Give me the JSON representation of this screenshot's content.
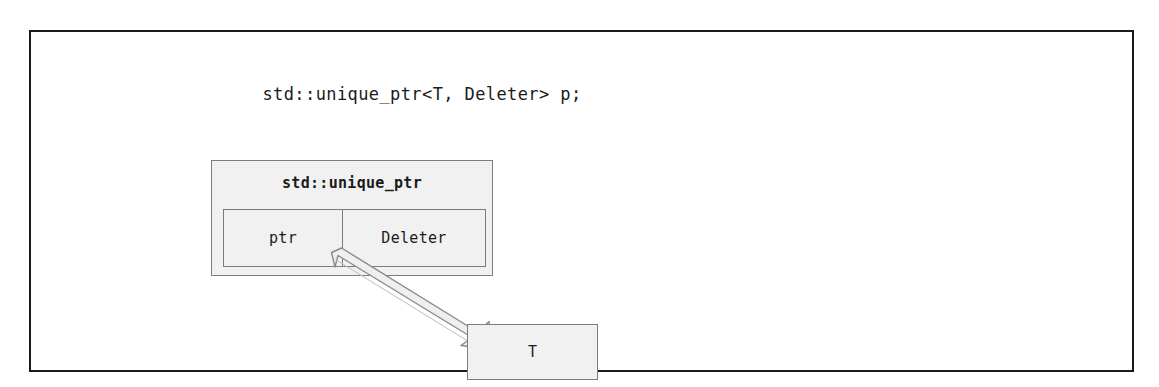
{
  "diagram": {
    "declaration": "std::unique_ptr<T, Deleter> p;",
    "uptr_box": {
      "title": "std::unique_ptr",
      "members": [
        {
          "label": "ptr"
        },
        {
          "label": "Deleter"
        }
      ]
    },
    "pointee_box": {
      "label": "T"
    },
    "arrow": {
      "name": "ptr-points-to-T"
    },
    "colors": {
      "frame_border": "#1a1a1a",
      "box_border": "#7d7d7d",
      "box_fill": "#f1f1f1",
      "text": "#1b1b1b",
      "arrow_fill": "#efefef",
      "arrow_stroke": "#808080",
      "page_background": "#ffffff"
    }
  }
}
